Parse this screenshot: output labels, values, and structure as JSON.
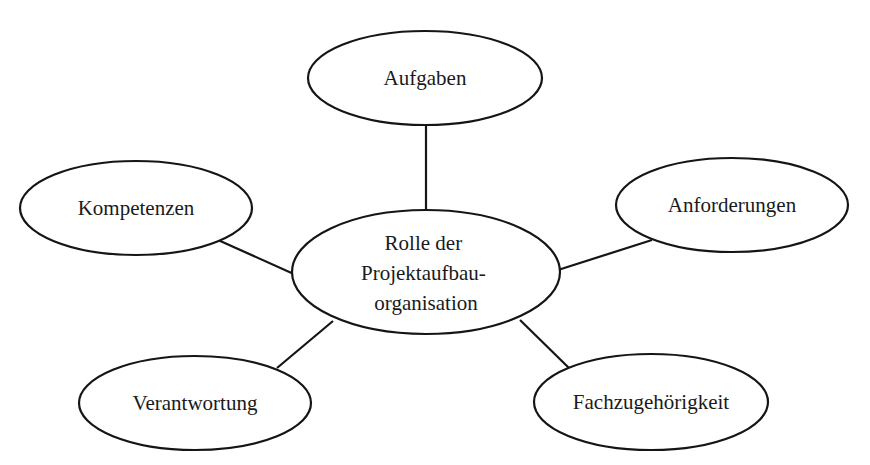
{
  "diagram": {
    "type": "mind-map",
    "center": {
      "lines": [
        "Rolle der",
        "Projektaufbau-",
        "organisation"
      ],
      "cx": 426,
      "cy": 272,
      "rx": 134,
      "ry": 62
    },
    "nodes": [
      {
        "id": "aufgaben",
        "label": "Aufgaben",
        "cx": 425,
        "cy": 78,
        "rx": 117,
        "ry": 47,
        "edge": {
          "x1": 426,
          "y1": 125,
          "x2": 426,
          "y2": 210
        }
      },
      {
        "id": "kompetenzen",
        "label": "Kompetenzen",
        "cx": 136,
        "cy": 208,
        "rx": 116,
        "ry": 47,
        "edge": {
          "x1": 218,
          "y1": 240,
          "x2": 296,
          "y2": 275
        }
      },
      {
        "id": "anforderungen",
        "label": "Anforderungen",
        "cx": 732,
        "cy": 205,
        "rx": 116,
        "ry": 47,
        "edge": {
          "x1": 652,
          "y1": 240,
          "x2": 558,
          "y2": 270
        }
      },
      {
        "id": "verantwortung",
        "label": "Verantwortung",
        "cx": 195,
        "cy": 403,
        "rx": 116,
        "ry": 47,
        "edge": {
          "x1": 277,
          "y1": 368,
          "x2": 333,
          "y2": 321
        }
      },
      {
        "id": "fachzugehoerigkeit",
        "label": "Fachzugehörigkeit",
        "cx": 651,
        "cy": 402,
        "rx": 117,
        "ry": 48,
        "edge": {
          "x1": 520,
          "y1": 320,
          "x2": 569,
          "y2": 368
        }
      }
    ],
    "colors": {
      "stroke": "#151515",
      "text": "#1a1a1a",
      "background": "#ffffff"
    }
  }
}
